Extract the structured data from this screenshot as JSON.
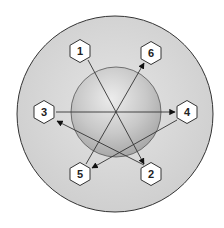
{
  "diagram": {
    "outer_circle_fill": "#d6d6d6",
    "inner_sphere_fill": "#c4c4c4",
    "stroke_color": "#333333",
    "nodes": [
      {
        "id": "1",
        "label": "1"
      },
      {
        "id": "2",
        "label": "2"
      },
      {
        "id": "3",
        "label": "3"
      },
      {
        "id": "4",
        "label": "4"
      },
      {
        "id": "5",
        "label": "5"
      },
      {
        "id": "6",
        "label": "6"
      }
    ],
    "arrows": [
      {
        "from": "1",
        "to": "2"
      },
      {
        "from": "3",
        "to": "4"
      },
      {
        "from": "5",
        "to": "6"
      },
      {
        "from": "4",
        "to": "5"
      },
      {
        "from": "2",
        "to": "3"
      }
    ]
  }
}
